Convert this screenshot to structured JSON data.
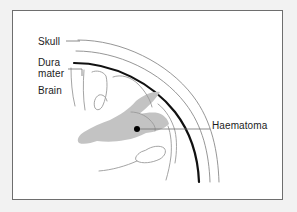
{
  "figure": {
    "background_color": "#f2f2f2",
    "panel_color": "#ffffff",
    "border_color": "#6e6e6e",
    "width": 297,
    "height": 212
  },
  "labels": {
    "skull": "Skull",
    "dura_line1": "Dura",
    "dura_line2": "mater",
    "brain": "Brain",
    "haematoma": "Haematoma"
  },
  "structures": {
    "skull_outer": {
      "name": "skull-outer-table",
      "stroke": "#8a8a8a",
      "stroke_width": 0.9
    },
    "skull_inner": {
      "name": "skull-inner-table",
      "stroke": "#8a8a8a",
      "stroke_width": 0.9
    },
    "dura_mater": {
      "name": "dura-mater",
      "stroke": "#111111",
      "stroke_width": 2.2
    },
    "brain": {
      "name": "brain-gyri",
      "stroke": "#9a9a9a",
      "stroke_width": 0.9,
      "fill": "none"
    },
    "haematoma": {
      "name": "haematoma-mass",
      "fill": "#c3c3c3",
      "stroke": "none"
    },
    "marker_dot": {
      "name": "haematoma-marker-dot",
      "fill": "#000000",
      "radius": 3.0,
      "x": 137,
      "y": 129
    },
    "leader_lines": {
      "stroke": "#6e6e6e",
      "stroke_width": 0.8
    }
  }
}
